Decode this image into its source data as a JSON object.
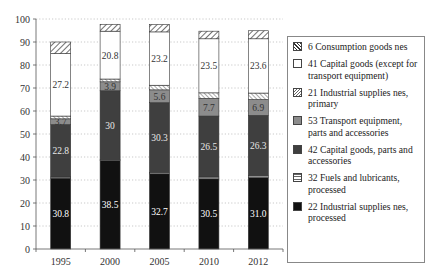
{
  "chart_data": {
    "type": "bar",
    "stacked": true,
    "title": "",
    "xlabel": "",
    "ylabel": "",
    "ylim": [
      0,
      100
    ],
    "yticks": [
      0,
      10,
      20,
      30,
      40,
      50,
      60,
      70,
      80,
      90,
      100
    ],
    "grid": "horizontal dotted",
    "legend_position": "right",
    "categories": [
      "1995",
      "2000",
      "2005",
      "2010",
      "2012"
    ],
    "series": [
      {
        "name": "22 Industrial supplies nes, processed",
        "color": "#111111",
        "pattern": "solid-black",
        "values": [
          30.8,
          38.5,
          32.7,
          30.5,
          31.0
        ],
        "labels": [
          "30.8",
          "38.5",
          "32.7",
          "30.5",
          "31.0"
        ]
      },
      {
        "name": "32 Fuels and lubricants, processed",
        "color": "#bbbbbb",
        "pattern": "horizontal-lines",
        "values": [
          0.5,
          0.3,
          0.6,
          0.8,
          0.8
        ],
        "labels": [
          "",
          "",
          "",
          "",
          ""
        ]
      },
      {
        "name": "42 Capital goods, parts and accessories",
        "color": "#444444",
        "pattern": "solid-dark-gray",
        "values": [
          22.8,
          30,
          30.3,
          26.5,
          26.3
        ],
        "labels": [
          "22.8",
          "30",
          "30.3",
          "26.5",
          "26.3"
        ]
      },
      {
        "name": "53 Transport equipment, parts and accessories",
        "color": "#8a8a8a",
        "pattern": "solid-mid-gray",
        "values": [
          2.5,
          3.9,
          5.6,
          7.7,
          6.9
        ],
        "labels": [
          "3.7",
          "3.9",
          "5.6",
          "7.7",
          "6.9"
        ]
      },
      {
        "name": "21 Industrial supplies nes, primary",
        "color": "#ffffff",
        "pattern": "fine-diagonal-hatch",
        "values": [
          1.2,
          1.2,
          2.0,
          2.4,
          2.8
        ],
        "labels": [
          "",
          "",
          "",
          "",
          ""
        ]
      },
      {
        "name": "41 Capital goods (except for transport equipment)",
        "color": "#ffffff",
        "pattern": "white",
        "values": [
          27.2,
          20.8,
          23.2,
          23.5,
          23.6
        ],
        "labels": [
          "27.2",
          "20.8",
          "23.2",
          "23.5",
          "23.6"
        ]
      },
      {
        "name": "6 Consumption goods nes",
        "color": "#ffffff",
        "pattern": "diagonal-hatch",
        "values": [
          5.0,
          3.0,
          3.2,
          3.3,
          3.5
        ],
        "labels": [
          "",
          "",
          "",
          "",
          ""
        ]
      }
    ]
  },
  "legend": {
    "items": [
      {
        "label": "6 Consumption goods nes",
        "key": "consumption"
      },
      {
        "label": "41 Capital goods (except for transport equipment)",
        "key": "capital41"
      },
      {
        "label": "21 Industrial supplies nes, primary",
        "key": "industrial21"
      },
      {
        "label": "53 Transport equipment, parts and accessories",
        "key": "transport53"
      },
      {
        "label": "42 Capital goods, parts and accessories",
        "key": "capital42"
      },
      {
        "label": "32 Fuels and lubricants, processed",
        "key": "fuels32"
      },
      {
        "label": "22 Industrial supplies nes, processed",
        "key": "industrial22"
      }
    ]
  }
}
